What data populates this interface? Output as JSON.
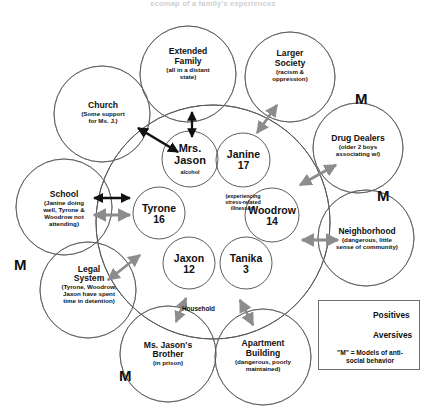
{
  "title": "ecomap of a family's experiences",
  "household_label": "Household",
  "family": {
    "members": [
      {
        "name": "Mrs.\nJason",
        "note": "alcohol"
      },
      {
        "name": "Janine",
        "age": "17",
        "note": "(experiencing\nstress-related\nillnesses)"
      },
      {
        "name": "Tyrone",
        "age": "16"
      },
      {
        "name": "Woodrow",
        "age": "14"
      },
      {
        "name": "Jaxon",
        "age": "12"
      },
      {
        "name": "Tanika",
        "age": "3"
      }
    ]
  },
  "systems": [
    {
      "name": "Extended\nFamily",
      "note": "(all in a distant\nstate)",
      "marker": ""
    },
    {
      "name": "Larger\nSociety",
      "note": "(racism &\noppression)",
      "marker": ""
    },
    {
      "name": "Church",
      "note": "(Some support\nfor Ms. J.)",
      "marker": ""
    },
    {
      "name": "Drug Dealers",
      "note": "(older 2 boys\nassociating w/)",
      "marker": "M"
    },
    {
      "name": "School",
      "note": "(Janine doing\nwell, Tyrone &\nWoodrow not\nattending)",
      "marker": ""
    },
    {
      "name": "Neighborhood",
      "note": "(dangerous, little\nsense of community)",
      "marker": "M"
    },
    {
      "name": "Legal\nSystem",
      "note": "(Tyrone, Woodrow,\nJaxon have spent\ntime in detention)",
      "marker": "M"
    },
    {
      "name": "Ms. Jason's\nBrother",
      "note": "(in prison)",
      "marker": "M"
    },
    {
      "name": "Apartment\nBuilding",
      "note": "(dangerous, poorly\nmaintained)",
      "marker": ""
    }
  ],
  "legend": {
    "positives": "Positives",
    "aversives": "Aversives",
    "marker_note": "\"M\" = Models of anti-\nsocial behavior"
  },
  "colors": {
    "positive": "#111111",
    "aversive": "#8c8c8c",
    "outline": "#5a5a5a"
  }
}
